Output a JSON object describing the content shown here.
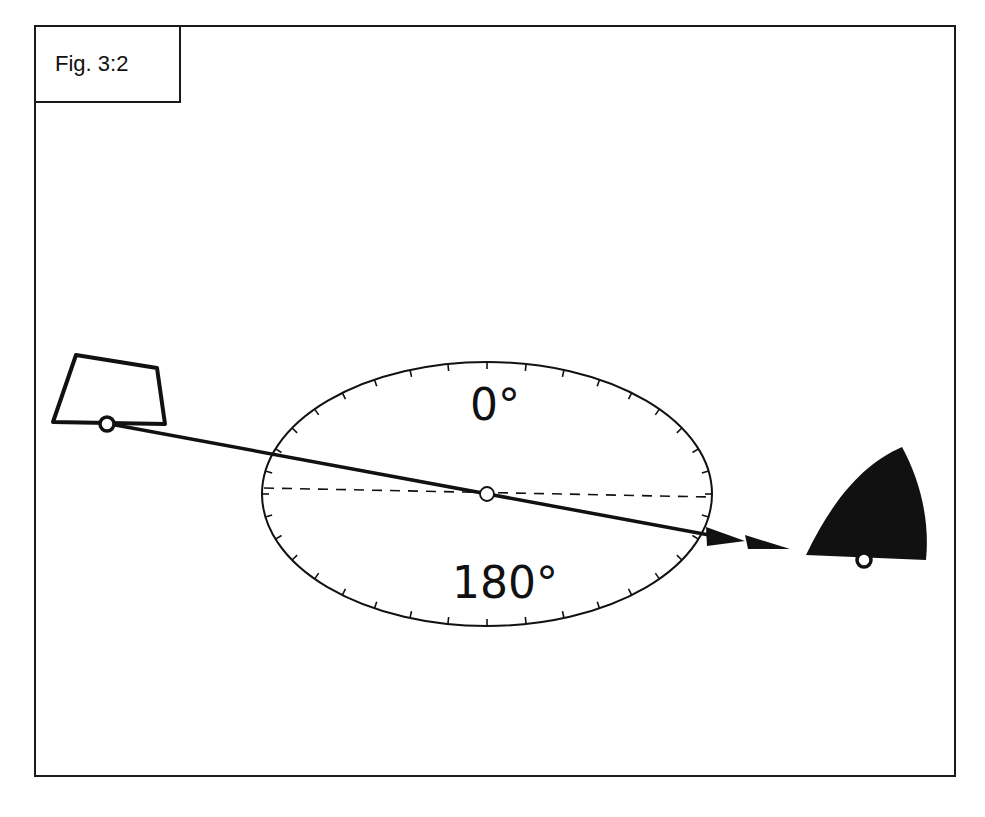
{
  "figure": {
    "label": "Fig. 3:2"
  },
  "dial": {
    "top_label": "0°",
    "bottom_label": "180°",
    "center": [
      487,
      494
    ],
    "rx": 225,
    "ry": 132,
    "tick_count": 36
  },
  "objects": {
    "left_shape": "outlined-trapezoid",
    "right_shape": "filled-sail-shape"
  },
  "colors": {
    "ink": "#111111",
    "background": "#ffffff"
  }
}
